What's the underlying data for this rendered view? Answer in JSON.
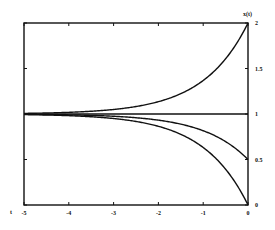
{
  "chart_data": {
    "type": "line",
    "title": "",
    "xlabel": "t",
    "ylabel": "x(t)",
    "xlim": [
      -5,
      0
    ],
    "ylim": [
      0,
      2
    ],
    "grid": false,
    "legend": null,
    "x_ticks": [
      "-5",
      "-4",
      "-3",
      "-2",
      "-1",
      "0"
    ],
    "y_ticks": [
      "0",
      "0.5",
      "1",
      "1.5",
      "2"
    ],
    "y_axis_position": "right",
    "x": [
      -5,
      -4,
      -3,
      -2,
      -1,
      -0.5,
      0
    ],
    "series": [
      {
        "name": "x(t)=1+e^t",
        "values": [
          1.007,
          1.018,
          1.05,
          1.135,
          1.368,
          1.607,
          2.0
        ]
      },
      {
        "name": "x(t)=1",
        "values": [
          1,
          1,
          1,
          1,
          1,
          1,
          1
        ]
      },
      {
        "name": "x(t)=1-0.5e^t",
        "values": [
          0.997,
          0.991,
          0.975,
          0.932,
          0.816,
          0.697,
          0.5
        ]
      },
      {
        "name": "x(t)=1-e^t",
        "values": [
          0.993,
          0.982,
          0.95,
          0.865,
          0.632,
          0.393,
          0.0
        ]
      }
    ]
  },
  "labels": {
    "x_axis": "t",
    "y_axis": "x(t)"
  }
}
